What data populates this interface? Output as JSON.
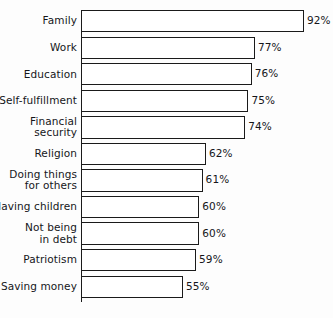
{
  "chart_data": {
    "type": "bar",
    "orientation": "horizontal",
    "title": "",
    "subtitle": "",
    "xlabel": "",
    "ylabel": "",
    "grid": false,
    "legend": null,
    "axis": {
      "value_suffix": "%",
      "xlim": [
        0,
        100
      ],
      "ticks_shown": false
    },
    "categories": [
      "Family",
      "Work",
      "Education",
      "Self-fulfillment",
      "Financial security",
      "Religion",
      "Doing things for others",
      "Having children",
      "Not being in debt",
      "Patriotism",
      "Saving money"
    ],
    "values": [
      92,
      77,
      76,
      75,
      74,
      62,
      61,
      60,
      60,
      59,
      55
    ],
    "data_labels": [
      "92%",
      "77%",
      "76%",
      "75%",
      "74%",
      "62%",
      "61%",
      "60%",
      "60%",
      "59%",
      "55%"
    ],
    "rows": [
      {
        "label_lines": [
          "Family"
        ],
        "value": 92,
        "label": "92%"
      },
      {
        "label_lines": [
          "Work"
        ],
        "value": 77,
        "label": "77%"
      },
      {
        "label_lines": [
          "Education"
        ],
        "value": 76,
        "label": "76%"
      },
      {
        "label_lines": [
          "Self-fulfillment"
        ],
        "value": 75,
        "label": "75%"
      },
      {
        "label_lines": [
          "Financial",
          "security"
        ],
        "value": 74,
        "label": "74%"
      },
      {
        "label_lines": [
          "Religion"
        ],
        "value": 62,
        "label": "62%"
      },
      {
        "label_lines": [
          "Doing things",
          "for others"
        ],
        "value": 61,
        "label": "61%"
      },
      {
        "label_lines": [
          "Having children"
        ],
        "value": 60,
        "label": "60%"
      },
      {
        "label_lines": [
          "Not being",
          "in debt"
        ],
        "value": 60,
        "label": "60%"
      },
      {
        "label_lines": [
          "Patriotism"
        ],
        "value": 59,
        "label": "59%"
      },
      {
        "label_lines": [
          "Saving money"
        ],
        "value": 55,
        "label": "55%"
      }
    ],
    "colors": {
      "bar_fill": "#ffffff",
      "bar_stroke": "#1a1a1a",
      "text": "#15161a",
      "background": "#fdfdfd"
    }
  }
}
